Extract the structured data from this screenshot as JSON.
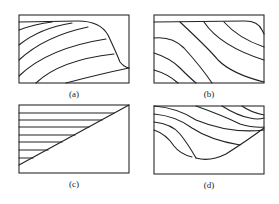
{
  "figure": {
    "panels": [
      {
        "id": "a",
        "label": "(a)",
        "description": "Curved contour lines bending toward top edge, bounded by an S-shaped boundary on the right"
      },
      {
        "id": "b",
        "label": "(b)",
        "description": "Diagonal curved contour lines sloping from upper-left to lower-right"
      },
      {
        "id": "c",
        "label": "(c)",
        "description": "Horizontal lines truncated by a straight diagonal boundary from lower-left to upper-right"
      },
      {
        "id": "d",
        "label": "(d)",
        "description": "Curved contour lines in upper region bounded by a concave curve below"
      }
    ],
    "colors": {
      "line": "#222222",
      "background": "#ffffff"
    }
  }
}
